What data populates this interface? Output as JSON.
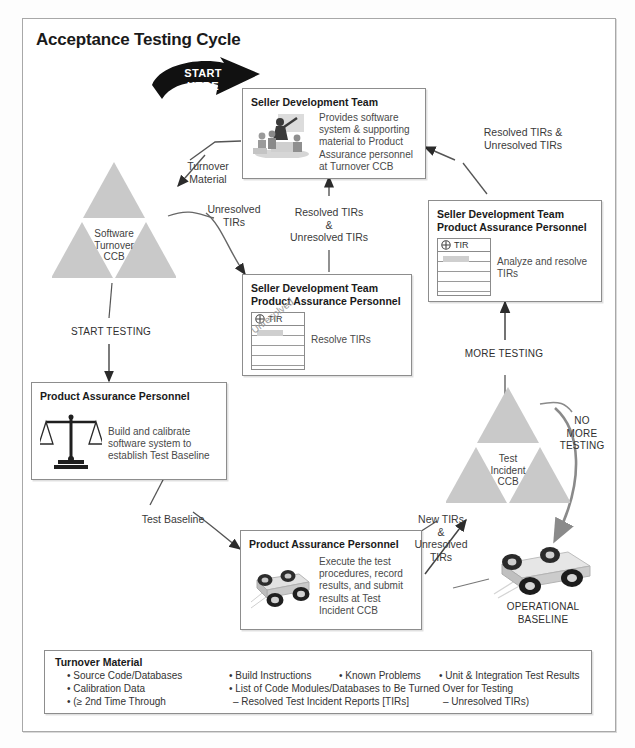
{
  "diagram": {
    "title": "Acceptance Testing Cycle",
    "start_marker": "START\nHERE"
  },
  "boxes": {
    "seller_dev_team": {
      "header": "Seller Development Team",
      "description": "Provides software system & supporting material to Product Assurance personnel at Turnover CCB",
      "icon": "meeting-presentation-icon"
    },
    "seller_pa_resolve": {
      "header": "Seller Development Team\nProduct Assurance Personnel",
      "description": "Resolve TIRs",
      "doc_label": "TIR",
      "doc_watermark": "Unresolved"
    },
    "seller_pa_analyze": {
      "header": "Seller Development Team\nProduct Assurance Personnel",
      "description": "Analyze and resolve TIRs",
      "doc_label": "TIR"
    },
    "pa_build": {
      "header": "Product Assurance Personnel",
      "description": "Build and calibrate software system to establish Test Baseline",
      "icon": "balance-scale-icon"
    },
    "pa_execute": {
      "header": "Product Assurance Personnel",
      "description": "Execute the test procedures, record results, and submit results at Test Incident CCB",
      "icon": "rover-vehicle-icon"
    }
  },
  "ccbs": {
    "software_turnover": "Software\nTurnover\nCCB",
    "test_incident": "Test\nIncident\nCCB"
  },
  "flow_labels": {
    "turnover_material": "Turnover\nMaterial",
    "unresolved_tirs": "Unresolved\nTIRs",
    "resolved_and_unresolved_center": "Resolved TIRs\n&\nUnresolved TIRs",
    "resolved_and_unresolved_right": "Resolved TIRs &\nUnresolved TIRs",
    "start_testing": "START TESTING",
    "test_baseline": "Test Baseline",
    "more_testing": "MORE TESTING",
    "no_more_testing": "NO\nMORE\nTESTING",
    "new_and_unresolved": "New TIRs\n&\nUnresolved\nTIRs",
    "operational_baseline": "OPERATIONAL\nBASELINE"
  },
  "legend": {
    "title": "Turnover Material",
    "rows": [
      [
        "• Source Code/Databases",
        "• Build Instructions",
        "• Known Problems",
        "• Unit & Integration Test Results"
      ],
      [
        "• Calibration Data",
        "• List of Code Modules/Databases to Be Turned Over for Testing"
      ],
      [
        "• (≥ 2nd Time Through",
        "– Resolved Test Incident Reports [TIRs]",
        "– Unresolved TIRs)"
      ]
    ]
  },
  "colors": {
    "frame_border": "#a8a8a8",
    "box_border": "#8d8d8d",
    "triangle_fill": "#c9c9c9",
    "text": "#231f20",
    "arrow": "#5a5a5a",
    "arrow_dark": "#2b2b2b",
    "start_arrow": "#111111"
  }
}
